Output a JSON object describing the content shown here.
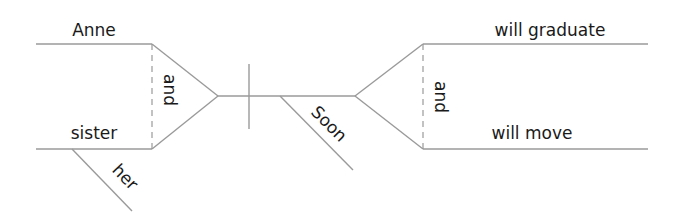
{
  "diagram": {
    "type": "Reed-Kellogg sentence diagram",
    "colors": {
      "line": "#9a9a9a",
      "text": "#1a1a1a",
      "background": "#ffffff"
    },
    "subject": {
      "compound": true,
      "items": [
        {
          "word": "Anne",
          "modifiers": []
        },
        {
          "word": "sister",
          "modifiers": [
            {
              "word": "her"
            }
          ]
        }
      ],
      "conjunction": "and"
    },
    "predicate": {
      "compound": true,
      "modifiers": [
        {
          "word": "Soon"
        }
      ],
      "items": [
        {
          "word": "will graduate"
        },
        {
          "word": "will move"
        }
      ],
      "conjunction": "and"
    }
  }
}
